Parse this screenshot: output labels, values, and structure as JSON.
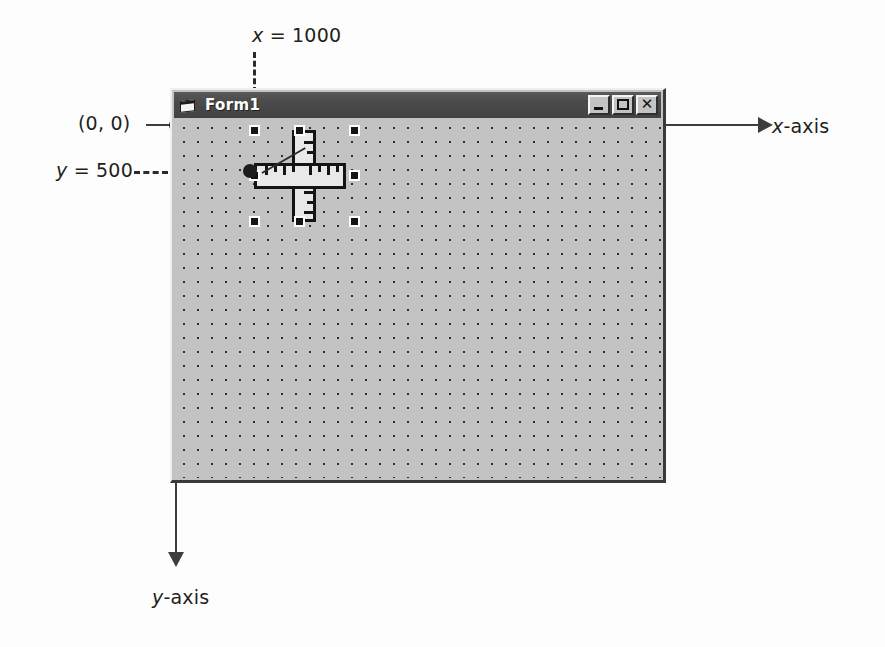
{
  "diagram": {
    "annotations": {
      "x_label": "x",
      "x_equals": " = 1000",
      "origin": "(0, 0)",
      "y_label": "y",
      "y_equals": " = 500",
      "point": "(1000, 500)",
      "x_axis_var": "x",
      "x_axis_rest": "-axis",
      "y_axis_var": "y",
      "y_axis_rest": "-axis"
    },
    "colors": {
      "line": "#3d3d3d",
      "dash": "#2b2b2b",
      "text": "#231f20",
      "form_face": "#c3c3c3",
      "titlebar": "#4b4b4b",
      "titlebar_text": "#ffffff",
      "grid_dot": "#2f2f2f",
      "handle_fill": "#141414",
      "handle_border": "#ffffff"
    }
  },
  "form": {
    "title": "Form1",
    "icon": "form-document-icon",
    "buttons": {
      "minimize": "minimize-button",
      "maximize": "maximize-button",
      "close": "close-button",
      "close_glyph": "✕"
    },
    "control": {
      "name": "ruler-control",
      "selected": true,
      "handle_count": 8
    },
    "grid": {
      "dot_spacing_px": 14,
      "visible": true
    }
  }
}
